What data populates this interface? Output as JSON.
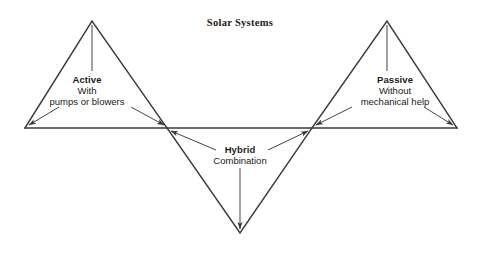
{
  "diagram": {
    "title": "Solar Systems",
    "type": "zigzag-triangle-diagram",
    "stroke_color": "#3a3a3a",
    "text_color": "#1a1a1a",
    "background_color": "#ffffff",
    "nodes": [
      {
        "name": "left-end",
        "x": 25,
        "y": 128
      },
      {
        "name": "left-apex",
        "x": 92,
        "y": 21
      },
      {
        "name": "left-junction",
        "x": 167,
        "y": 128
      },
      {
        "name": "bottom-vertex",
        "x": 240,
        "y": 233
      },
      {
        "name": "right-junction",
        "x": 312,
        "y": 128
      },
      {
        "name": "right-apex",
        "x": 387,
        "y": 21
      },
      {
        "name": "right-end",
        "x": 457,
        "y": 128
      }
    ],
    "labels": [
      {
        "id": "active",
        "heading": "Active",
        "lines": [
          "With",
          "pumps or blowers"
        ]
      },
      {
        "id": "passive",
        "heading": "Passive",
        "lines": [
          "Without",
          "mechanical help"
        ]
      },
      {
        "id": "hybrid",
        "heading": "Hybrid",
        "lines": [
          "Combination"
        ]
      }
    ]
  }
}
